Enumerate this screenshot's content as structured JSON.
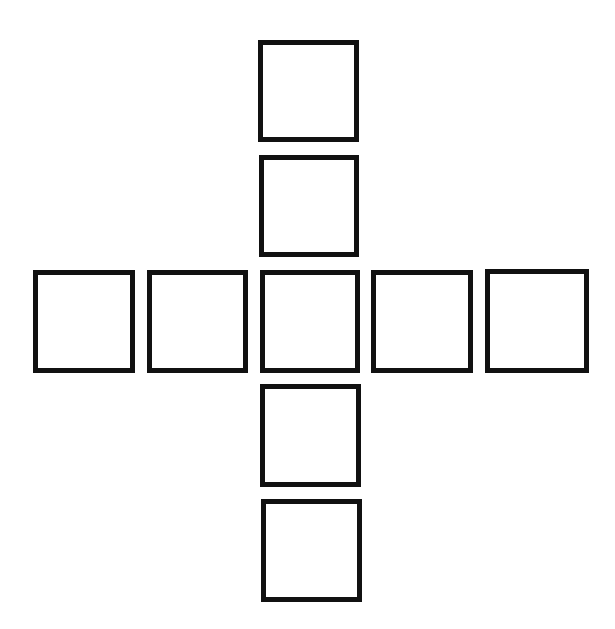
{
  "diagram": {
    "type": "cross-of-squares",
    "stroke_color": "#111111",
    "fill_color": "#ffffff",
    "background_color": "#ffffff",
    "stroke_width": 5,
    "squares": [
      {
        "id": "top-1",
        "row": 0,
        "col": 2,
        "x": 258,
        "y": 40,
        "w": 101,
        "h": 102
      },
      {
        "id": "top-2",
        "row": 1,
        "col": 2,
        "x": 259,
        "y": 155,
        "w": 100,
        "h": 102
      },
      {
        "id": "left-2",
        "row": 2,
        "col": 0,
        "x": 33,
        "y": 270,
        "w": 102,
        "h": 103
      },
      {
        "id": "left-1",
        "row": 2,
        "col": 1,
        "x": 147,
        "y": 270,
        "w": 101,
        "h": 103
      },
      {
        "id": "center",
        "row": 2,
        "col": 2,
        "x": 260,
        "y": 270,
        "w": 100,
        "h": 103
      },
      {
        "id": "right-1",
        "row": 2,
        "col": 3,
        "x": 371,
        "y": 270,
        "w": 102,
        "h": 103
      },
      {
        "id": "right-2",
        "row": 2,
        "col": 4,
        "x": 485,
        "y": 269,
        "w": 104,
        "h": 104
      },
      {
        "id": "bottom-1",
        "row": 3,
        "col": 2,
        "x": 260,
        "y": 384,
        "w": 101,
        "h": 103
      },
      {
        "id": "bottom-2",
        "row": 4,
        "col": 2,
        "x": 261,
        "y": 499,
        "w": 101,
        "h": 103
      }
    ]
  }
}
